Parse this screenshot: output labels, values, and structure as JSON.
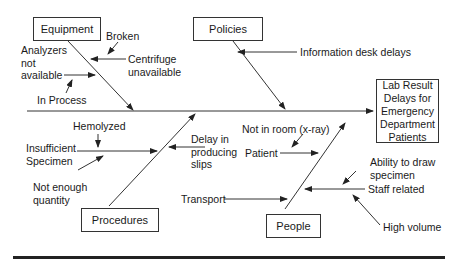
{
  "effect": "Lab Result\nDelays for\nEmergency\nDepartment\nPatients",
  "categories": {
    "equipment": "Equipment",
    "policies": "Policies",
    "procedures": "Procedures",
    "people": "People"
  },
  "causes": {
    "analyzers": "Analyzers\nnot\navailable",
    "broken": "Broken",
    "centrifuge": "Centrifuge\nunavailable",
    "in_process": "In Process",
    "info_desk": "Information desk delays",
    "hemolyzed": "Hemolyzed",
    "insufficient": "Insufficient\nSpecimen",
    "not_enough": "Not enough\nquantity",
    "delay_slips": "Delay in\nproducing\nslips",
    "not_in_room": "Not in room (x-ray)",
    "patient": "Patient",
    "transport": "Transport",
    "ability": "Ability to draw\nspecimen",
    "staff": "Staff related",
    "high_volume": "High volume"
  }
}
